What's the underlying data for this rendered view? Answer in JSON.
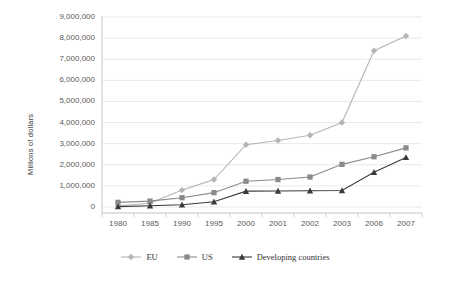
{
  "chart_data": {
    "type": "line",
    "title": "",
    "xlabel": "",
    "ylabel": "Millions of dollars",
    "categories": [
      "1980",
      "1985",
      "1990",
      "1995",
      "2000",
      "2001",
      "2002",
      "2003",
      "2006",
      "2007"
    ],
    "ylim": [
      0,
      9000000
    ],
    "ytick_step": 1000000,
    "ytick_labels": [
      "9,000,000",
      "8,000,000",
      "7,000,000",
      "6,000,000",
      "5,000,000",
      "4,000,000",
      "3,000,000",
      "2,000,000",
      "1,000,000",
      "0"
    ],
    "grid": true,
    "legend_position": "bottom",
    "series": [
      {
        "name": "EU",
        "marker": "diamond",
        "color": "#b5b5b5",
        "values": [
          60000,
          180000,
          800000,
          1300000,
          2950000,
          3150000,
          3400000,
          4000000,
          7400000,
          8100000
        ]
      },
      {
        "name": "US",
        "marker": "square",
        "color": "#8a8a8a",
        "values": [
          220000,
          280000,
          440000,
          680000,
          1220000,
          1300000,
          1420000,
          2020000,
          2380000,
          2800000
        ]
      },
      {
        "name": "Developing countries",
        "marker": "triangle",
        "color": "#3a3a3a",
        "values": [
          20000,
          60000,
          110000,
          250000,
          750000,
          760000,
          770000,
          780000,
          1650000,
          2350000
        ]
      }
    ]
  },
  "legend": {
    "items": [
      {
        "label": "EU"
      },
      {
        "label": "US"
      },
      {
        "label": "Developing countries"
      }
    ]
  }
}
